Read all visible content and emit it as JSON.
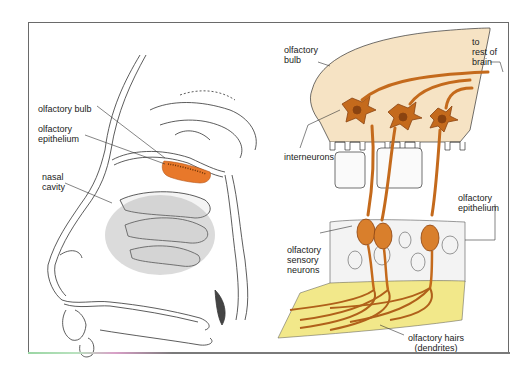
{
  "figure": {
    "left_panel": {
      "title": "Sagittal section of the head showing the nasal cavity",
      "labels": [
        {
          "id": "olfactory-bulb",
          "text": "olfactory bulb"
        },
        {
          "id": "olfactory-epithelium",
          "text": "olfactory\nepithelium"
        },
        {
          "id": "nasal-cavity",
          "text": "nasal\ncavity"
        }
      ]
    },
    "right_panel": {
      "title": "Enlarged view of olfactory bulb and epithelium",
      "labels": [
        {
          "id": "olfactory-bulb",
          "text": "olfactory\nbulb"
        },
        {
          "id": "to-rest-of-brain",
          "text": "to\nrest of\nbrain"
        },
        {
          "id": "interneurons",
          "text": "interneurons"
        },
        {
          "id": "olfactory-epithelium",
          "text": "olfactory\nepithelium"
        },
        {
          "id": "olfactory-sensory-neurons",
          "text": "olfactory\nsensory\nneurons"
        },
        {
          "id": "olfactory-hairs",
          "text": "olfactory hairs\n(dendrites)"
        }
      ]
    },
    "colors": {
      "bulb_fill": "#f6e3c4",
      "neuron": "#c46a1c",
      "neuron_dark": "#8a4310",
      "epithelium_highlight": "#e8782a",
      "mucus_layer": "#f2e88a",
      "line": "#333333",
      "frame": "#6a6a6a"
    }
  }
}
